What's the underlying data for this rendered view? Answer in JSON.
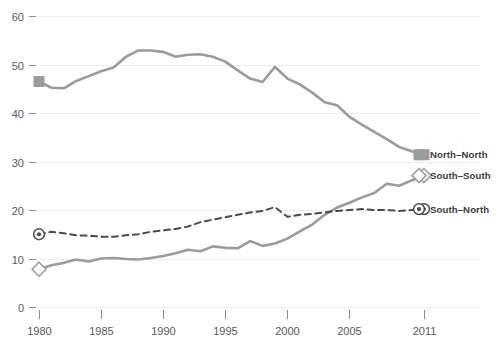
{
  "chart_data": {
    "type": "line",
    "title": "",
    "subtitle": "",
    "xlabel": "",
    "ylabel": "",
    "xlim": [
      1980,
      2011
    ],
    "ylim": [
      0,
      60
    ],
    "grid": true,
    "grid_axis": "y",
    "legend_position": "right-inside",
    "x_tick_labels": [
      "1980",
      "1985",
      "1990",
      "1995",
      "2000",
      "2005",
      "2011"
    ],
    "x_ticks": [
      1980,
      1985,
      1990,
      1995,
      2000,
      2005,
      2011
    ],
    "y_tick_labels": [
      "0",
      "10",
      "20",
      "30",
      "40",
      "50",
      "60"
    ],
    "y_ticks": [
      0,
      10,
      20,
      30,
      40,
      50,
      60
    ],
    "x": [
      1980,
      1981,
      1982,
      1983,
      1984,
      1985,
      1986,
      1987,
      1988,
      1989,
      1990,
      1991,
      1992,
      1993,
      1994,
      1995,
      1996,
      1997,
      1998,
      1999,
      2000,
      2001,
      2002,
      2003,
      2004,
      2005,
      2006,
      2007,
      2008,
      2009,
      2010,
      2011
    ],
    "series": [
      {
        "name": "North–North",
        "key": "north-north",
        "color": "#9a9b9d",
        "style": "solid",
        "marker": "filled-square",
        "marker_at": "endpoints",
        "values": [
          46.5,
          45.2,
          45.1,
          46.6,
          47.6,
          48.6,
          49.4,
          51.6,
          52.9,
          52.9,
          52.6,
          51.6,
          52.0,
          52.1,
          51.6,
          50.6,
          48.8,
          47.1,
          46.4,
          49.5,
          47.1,
          45.9,
          44.2,
          42.2,
          41.6,
          39.2,
          37.6,
          36.1,
          34.6,
          33.0,
          32.1,
          31.4
        ]
      },
      {
        "name": "South–South",
        "key": "south-south",
        "color": "#9a9b9d",
        "style": "solid",
        "marker": "open-diamond",
        "marker_at": "endpoints",
        "values": [
          7.8,
          8.6,
          9.1,
          9.8,
          9.4,
          10.0,
          10.1,
          9.9,
          9.8,
          10.1,
          10.5,
          11.1,
          11.8,
          11.5,
          12.5,
          12.2,
          12.1,
          13.6,
          12.6,
          13.1,
          14.1,
          15.6,
          17.0,
          19.0,
          20.5,
          21.5,
          22.6,
          23.5,
          25.4,
          25.0,
          26.1,
          27.1
        ]
      },
      {
        "name": "South–North",
        "key": "south-north",
        "color": "#4b4b4d",
        "style": "dashed",
        "marker": "bullseye",
        "marker_at": "endpoints",
        "values": [
          15.0,
          15.5,
          15.2,
          14.8,
          14.7,
          14.5,
          14.5,
          14.8,
          15.0,
          15.5,
          15.8,
          16.1,
          16.6,
          17.5,
          18.0,
          18.5,
          19.0,
          19.5,
          19.8,
          20.6,
          18.6,
          19.0,
          19.2,
          19.5,
          19.8,
          20.0,
          20.2,
          20.0,
          20.0,
          19.8,
          20.0,
          20.2
        ]
      }
    ],
    "annotations": []
  },
  "legend": {
    "items": [
      {
        "label": "North–North",
        "marker": "filled-square",
        "color": "#9a9b9d"
      },
      {
        "label": "South–South",
        "marker": "open-diamond",
        "color": "#9a9b9d"
      },
      {
        "label": "South–North",
        "marker": "bullseye",
        "color": "#4b4b4d"
      }
    ]
  },
  "colors": {
    "background": "#ffffff",
    "gridline": "#ececed",
    "tick": "#8a8c8e",
    "tick_label": "#58595b",
    "legend_label": "#3b3b3d",
    "series_light": "#9a9b9d",
    "series_dark": "#4b4b4d"
  }
}
